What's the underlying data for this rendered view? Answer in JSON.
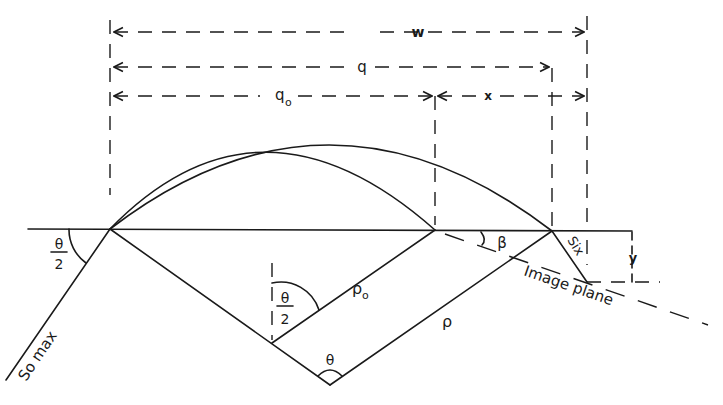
{
  "figure": {
    "type": "geometric optics diagram",
    "labels": {
      "w": "w",
      "q": "q",
      "q0": "q",
      "q0_sub": "o",
      "x": "x",
      "y": "y",
      "theta": "θ",
      "theta_half_num": "θ",
      "theta_half_den": "2",
      "theta_half_inner_num": "θ",
      "theta_half_inner_den": "2",
      "beta": "β",
      "rho": "ρ",
      "rho0": "ρ",
      "rho0_sub": "o",
      "six": "Six",
      "so_max": "So max",
      "image_plane": "Image plane"
    },
    "colors": {
      "ink": "#1a1a1a",
      "background": "#ffffff"
    }
  }
}
